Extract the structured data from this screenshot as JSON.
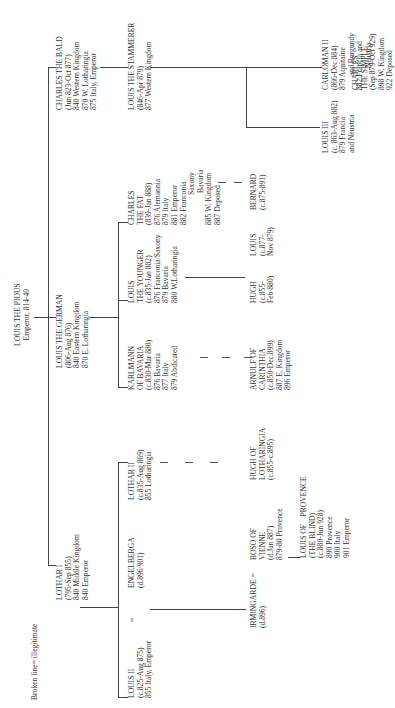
{
  "legend": "Broken line= illegitimate",
  "root": {
    "name": "LOUIS THE PIOUS",
    "lines": [
      "Emperor, 814-40"
    ]
  },
  "gen1": {
    "lothar1": {
      "name": "LOTHAR I",
      "lines": [
        "(795-Sep 855)",
        "840 Middle Kingdom",
        "840 Emperor"
      ]
    },
    "louis_german": {
      "name": "LOUIS THE GERMAN",
      "lines": [
        "(806-Aug 876)",
        "840 Eastern Kingdom",
        "870 E. Lotharingia"
      ]
    },
    "charles_bald": {
      "name": "CHARLES THE BALD",
      "lines": [
        "(Jun 823-Oct 877)",
        "840 Western Kingdom",
        "870 W. Lotharingia",
        "875 Italy, Emperor"
      ]
    }
  },
  "gen2": {
    "louis2": {
      "name": "LOUIS II",
      "lines": [
        "(c.825-Aug 875)",
        "855 Italy, Emperor"
      ]
    },
    "engelberga": {
      "name": "ENGELBERGA",
      "lines": [
        "(d.896/901)"
      ]
    },
    "lothar2": {
      "name": "LOTHAR II",
      "lines": [
        "(c.835-Aug 869)",
        "855 Lotharingia"
      ]
    },
    "karlmann": {
      "name": "KARLMANN",
      "lines": [
        "OF BAVARIA",
        "(c.830-Mar 880)",
        "876 Bavaria",
        "877 Italy",
        "879 Abdicated"
      ]
    },
    "louis_younger": {
      "name": "LOUIS",
      "lines": [
        "THE YOUNGER",
        "(c.835-Jan 882)",
        "876 Franconia/Saxony",
        "879 Bavaria",
        "880 W.Lotharingia"
      ]
    },
    "charles_fat": {
      "name": "CHARLES",
      "lines": [
        "THE FAT",
        "(839-Jan 888)",
        "876 Alemannia",
        "879 Italy",
        "881 Emperor",
        "882 Franconia",
        "Saxony",
        "Bavaria",
        "885 W. Kingdom",
        "887 Deposed"
      ]
    },
    "louis_stammerer": {
      "name": "LOUIS THE STAMMERER",
      "lines": [
        "(846-Apr 879)",
        "877 Western Kingdom"
      ]
    }
  },
  "equals": "=",
  "gen3": {
    "irmingarde": {
      "name": "IRMINGARDE =",
      "lines": [
        "(d.896)"
      ]
    },
    "boso": {
      "name": "BOSO OF",
      "lines": [
        "VIENNE",
        "(d.Jan 887)",
        "879-80 Provence"
      ]
    },
    "hugh_loth": {
      "name": "HUGH OF",
      "lines": [
        "LOTHARINGIA",
        "(c.855-c.895)"
      ]
    },
    "arnulf": {
      "name": "ARNULF OF",
      "lines": [
        "CARINTHIA",
        "(c.850-Dec.899)",
        "887 E. Kingdom",
        "896 Emperor"
      ]
    },
    "hugh": {
      "name": "HUGH",
      "lines": [
        "(c.855-",
        "Feb 880)"
      ]
    },
    "louis_877": {
      "name": "LOUIS",
      "lines": [
        "(c.877-",
        "Nov 879)"
      ]
    },
    "bernard": {
      "name": "BERNARD",
      "lines": [
        "(c.875-891)"
      ]
    },
    "louis3": {
      "name": "LOUIS III",
      "lines": [
        "(c. 863-Aug 882)",
        "879 Francia",
        "and Neustria"
      ]
    },
    "carloman2": {
      "name": "CARLOMAN II",
      "lines": [
        "(866-Dec 884)",
        "879 Aquitaine",
        "and Burgundy",
        "882 Francia and",
        "Neustria"
      ]
    },
    "charles_simple": {
      "name": "CHARLES",
      "lines": [
        "THE SIMPLE",
        "(Sep 879-Oct 929)",
        "898 W. Kingdom",
        "922 Deposed"
      ]
    }
  },
  "gen4": {
    "louis_provence": {
      "name": "LOUIS OF    PROVENCE",
      "lines": [
        "(THE BLIND)",
        "(c.880-Jun 928)",
        "890 Provence",
        "900 Italy",
        "901 Emperor"
      ]
    }
  }
}
